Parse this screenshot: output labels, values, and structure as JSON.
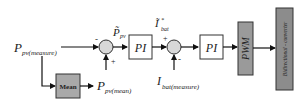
{
  "diagram": {
    "type": "control-block-diagram",
    "inputs": {
      "p_pv_measure": {
        "main": "P",
        "sub": "pv(measure)"
      },
      "p_pv_mean": {
        "main": "P",
        "sub": "pv(mean)"
      },
      "i_bat_measure": {
        "main": "I",
        "sub": "bat(measure)"
      }
    },
    "signals": {
      "p_pv_tilde": {
        "main": "P̃",
        "sub": "pv"
      },
      "i_bat_ref": {
        "main": "Ĩ",
        "sup": "*",
        "sub": "bat"
      }
    },
    "blocks": {
      "mean": "Mean",
      "pi1": "PI",
      "pi2": "PI",
      "pwm": "PWM",
      "converter": "Bidirectional - converter"
    },
    "summing_junctions": {
      "sum1": {
        "top_sign": "-",
        "bottom_sign": "+"
      },
      "sum2": {
        "top_sign": "+",
        "bottom_sign": "-"
      }
    },
    "colors": {
      "line": "#111111",
      "mean_fill": "#a9a9a9",
      "pwm_fill": "#9a9a9a",
      "converter_fill": "#8c8c8c",
      "junction_fill": "#d8d8d8",
      "pi_fill": "#ffffff"
    }
  }
}
